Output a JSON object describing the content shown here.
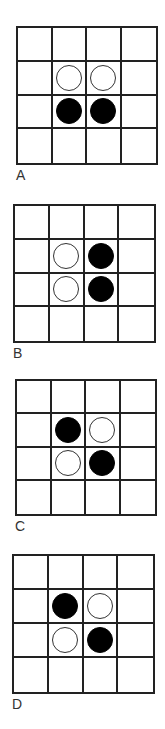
{
  "colors": {
    "grid": "#222222",
    "black_piece": "#000000",
    "white_piece": "#ffffff",
    "label": "#333333"
  },
  "boards": [
    {
      "label": "A",
      "rect": {
        "x": 16,
        "y": 26,
        "w": 142,
        "h": 139
      },
      "label_pos": {
        "x": 16,
        "y": 168
      },
      "grid": [
        [
          "",
          "",
          "",
          ""
        ],
        [
          "",
          "white",
          "white",
          ""
        ],
        [
          "",
          "black",
          "black",
          ""
        ],
        [
          "",
          "",
          "",
          ""
        ]
      ]
    },
    {
      "label": "B",
      "rect": {
        "x": 13,
        "y": 204,
        "w": 143,
        "h": 139
      },
      "label_pos": {
        "x": 13,
        "y": 346
      },
      "grid": [
        [
          "",
          "",
          "",
          ""
        ],
        [
          "",
          "white",
          "black",
          ""
        ],
        [
          "",
          "white",
          "black",
          ""
        ],
        [
          "",
          "",
          "",
          ""
        ]
      ]
    },
    {
      "label": "C",
      "rect": {
        "x": 15,
        "y": 379,
        "w": 142,
        "h": 137
      },
      "label_pos": {
        "x": 15,
        "y": 519
      },
      "grid": [
        [
          "",
          "",
          "",
          ""
        ],
        [
          "",
          "black",
          "white",
          ""
        ],
        [
          "",
          "white",
          "black",
          ""
        ],
        [
          "",
          "",
          "",
          ""
        ]
      ]
    },
    {
      "label": "D",
      "rect": {
        "x": 12,
        "y": 554,
        "w": 143,
        "h": 140
      },
      "label_pos": {
        "x": 12,
        "y": 697
      },
      "grid": [
        [
          "",
          "",
          "",
          ""
        ],
        [
          "",
          "black",
          "white",
          ""
        ],
        [
          "",
          "white",
          "black",
          ""
        ],
        [
          "",
          "",
          "",
          ""
        ]
      ]
    }
  ]
}
